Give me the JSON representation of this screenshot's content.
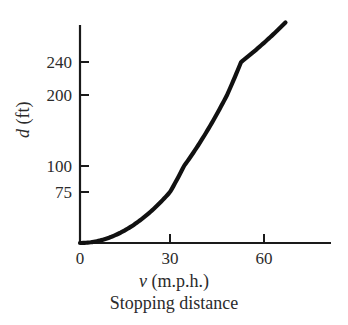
{
  "figure": {
    "caption": "Stopping distance",
    "background_color": "#ffffff",
    "ink_color": "#1a1a1a"
  },
  "axes": {
    "x_title_var": "v",
    "x_title_units": " (m.p.h.)",
    "y_title_var": "d",
    "y_title_units": " (ft)"
  },
  "chart_data": {
    "type": "line",
    "title": "Stopping distance",
    "xlabel": "v (m.p.h.)",
    "ylabel": "d (ft)",
    "grid": false,
    "legend": "none",
    "xlim": [
      0,
      80
    ],
    "ylim": [
      0,
      280
    ],
    "x_ticks": [
      0,
      30,
      60
    ],
    "x_tick_labels": [
      "0",
      "30",
      "60"
    ],
    "y_ticks": [
      75,
      100,
      200,
      240
    ],
    "y_tick_labels": [
      "75",
      "100",
      "200",
      "240"
    ],
    "y_axis_note": "broken/non-linear vertical scale; spacing between 75 and 100 is compressed relative to 200 to 240",
    "curve_relation": "d = v^2 / 11.5",
    "x": [
      0,
      5,
      10,
      15,
      20,
      25,
      30,
      35,
      40,
      45,
      50,
      55,
      60,
      65,
      67
    ],
    "values": [
      0,
      2,
      9,
      20,
      35,
      54,
      78,
      107,
      139,
      176,
      217,
      263,
      313,
      367,
      390
    ],
    "series": [
      {
        "name": "stopping distance",
        "values": [
          0,
          2,
          9,
          20,
          35,
          54,
          78,
          107,
          139,
          176,
          217,
          263,
          313,
          367,
          390
        ]
      }
    ],
    "line_color": "#111111",
    "line_width": 4
  },
  "ticks": {
    "y": [
      {
        "label": "240",
        "px": 62
      },
      {
        "label": "200",
        "px": 95
      },
      {
        "label": "100",
        "px": 166
      },
      {
        "label": "75",
        "px": 192
      }
    ],
    "x": [
      {
        "label": "0",
        "px": 80
      },
      {
        "label": "30",
        "px": 170
      },
      {
        "label": "60",
        "px": 264
      }
    ]
  }
}
